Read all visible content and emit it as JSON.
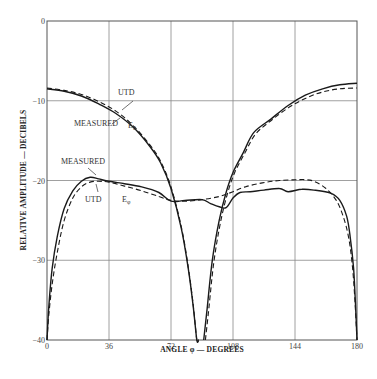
{
  "chart_data": {
    "type": "line",
    "title": "",
    "xlabel": "ANGLE φ — DEGREES",
    "ylabel": "RELATIVE AMPLITUDE — DECIBELS",
    "xlim": [
      0,
      180
    ],
    "ylim": [
      -40,
      0
    ],
    "x_ticks": [
      0,
      36,
      72,
      108,
      144,
      180
    ],
    "y_ticks": [
      0,
      -10,
      -20,
      -30,
      -40
    ],
    "y_tick_labels": [
      "0",
      "−10",
      "−20",
      "−30",
      "−40"
    ],
    "grid": true,
    "legend": null,
    "series": [
      {
        "name": "Eθ MEASURED",
        "style": "solid",
        "x": [
          0,
          10,
          20,
          30,
          40,
          50,
          60,
          66,
          72,
          78,
          82,
          85,
          87,
          88
        ],
        "y": [
          -8.5,
          -8.8,
          -9.4,
          -10.4,
          -11.6,
          -13.3,
          -15.8,
          -17.8,
          -21,
          -26,
          -31,
          -36,
          -40,
          -40
        ]
      },
      {
        "name": "Eθ UTD",
        "style": "dashed",
        "x": [
          0,
          10,
          20,
          30,
          40,
          50,
          60,
          66,
          72,
          78,
          82,
          85,
          87,
          88
        ],
        "y": [
          -8.4,
          -8.7,
          -9.2,
          -10.1,
          -11.3,
          -13.1,
          -15.6,
          -17.6,
          -20.8,
          -25.8,
          -30.8,
          -35.8,
          -40,
          -40
        ]
      },
      {
        "name": "Eθ MEASURED (right lobe)",
        "style": "solid",
        "x": [
          91,
          93,
          96,
          100,
          104,
          108,
          114,
          120,
          130,
          140,
          150,
          160,
          170,
          180
        ],
        "y": [
          -40,
          -36,
          -30,
          -25,
          -21.5,
          -19,
          -16.5,
          -14,
          -12.3,
          -10.6,
          -9.3,
          -8.5,
          -8.0,
          -7.8
        ]
      },
      {
        "name": "Eθ UTD (right lobe)",
        "style": "dashed",
        "x": [
          92,
          94,
          97,
          101,
          105,
          109,
          115,
          121,
          130,
          140,
          150,
          160,
          170,
          180
        ],
        "y": [
          -40,
          -36,
          -30,
          -25,
          -21.5,
          -19,
          -16.5,
          -14.2,
          -12.5,
          -10.9,
          -9.7,
          -8.9,
          -8.5,
          -8.4
        ]
      },
      {
        "name": "Eφ MEASURED",
        "style": "solid",
        "x": [
          0,
          1,
          3,
          6,
          10,
          15,
          20,
          25,
          30,
          36,
          45,
          55,
          65,
          72,
          80,
          90,
          95,
          100,
          104,
          108,
          112,
          118,
          126,
          135,
          140,
          148,
          155,
          165,
          170,
          174,
          176,
          178,
          179,
          180
        ],
        "y": [
          -40,
          -36,
          -31,
          -27,
          -23.5,
          -21.3,
          -20.1,
          -19.6,
          -19.8,
          -20.1,
          -20.4,
          -20.8,
          -21.5,
          -22.6,
          -22.5,
          -22.4,
          -22.9,
          -23.3,
          -23.4,
          -22.2,
          -21.5,
          -21.4,
          -21.2,
          -21.0,
          -21.4,
          -21.1,
          -21.2,
          -21.6,
          -22.5,
          -24.5,
          -27,
          -31,
          -35,
          -40
        ]
      },
      {
        "name": "Eφ UTD",
        "style": "dashed",
        "x": [
          0,
          1,
          3,
          6,
          10,
          15,
          20,
          25,
          30,
          36,
          45,
          55,
          65,
          72,
          80,
          90,
          100,
          108,
          115,
          125,
          135,
          145,
          150,
          155,
          162,
          168,
          172,
          175,
          177,
          178.5,
          180
        ],
        "y": [
          -40,
          -37,
          -33,
          -29,
          -25,
          -22.2,
          -20.8,
          -20.2,
          -20.1,
          -20.2,
          -20.7,
          -21.3,
          -22,
          -22.5,
          -22.6,
          -22.4,
          -22.0,
          -21.4,
          -20.8,
          -20.3,
          -20.0,
          -19.9,
          -19.9,
          -20.1,
          -21.0,
          -22.5,
          -24.5,
          -27,
          -30,
          -34,
          -40
        ]
      }
    ],
    "annotations": [
      {
        "text": "UTD",
        "target": "Eθ UTD",
        "x": 52,
        "y": -9.3
      },
      {
        "text": "MEASURED",
        "target": "Eθ MEASURED",
        "x": 22,
        "y": -12.5
      },
      {
        "text": "Eθ",
        "target": "Eθ curves",
        "x": 45,
        "y": -13.2
      },
      {
        "text": "MEASURED",
        "target": "Eφ MEASURED",
        "x": 4,
        "y": -17.2
      },
      {
        "text": "UTD",
        "target": "Eφ UTD",
        "x": 22,
        "y": -22.6
      },
      {
        "text": "Eφ",
        "target": "Eφ curves",
        "x": 45,
        "y": -22.4
      }
    ]
  },
  "labels": {
    "utd_top": "UTD",
    "measured_top": "MEASURED",
    "e_theta": "E",
    "e_theta_sub": "θ",
    "measured_bottom": "MEASURED",
    "utd_bottom": "UTD",
    "e_phi": "E",
    "e_phi_sub": "φ"
  }
}
